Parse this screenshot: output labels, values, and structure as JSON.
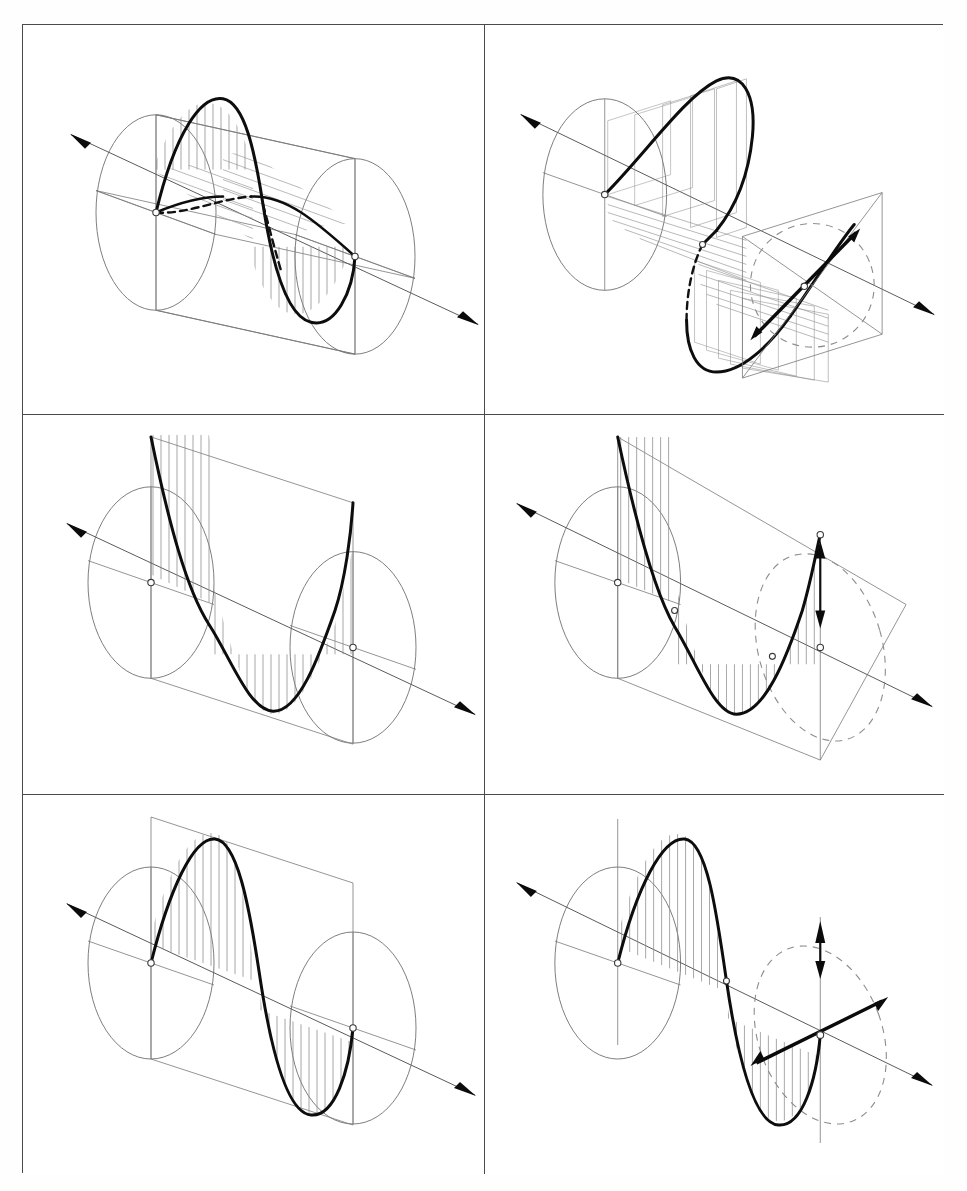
{
  "figure": {
    "layout": {
      "columns": 2,
      "rows": 3,
      "panel_count": 6
    },
    "style": {
      "background": "#ffffff",
      "frame_color": "#4a4a4a",
      "curve_color": "#0d0d0d",
      "construction_color": "#7a7a7a",
      "hatch_color": "#8a8a8a",
      "dashed_color": "#8d8d8d"
    }
  },
  "panels": [
    {
      "id": "panel-1",
      "position": "top-left",
      "name": "circularly-polarized-wave-in-cylinder",
      "description": "Two orthogonal sine components drawn inside a transparent cylinder; vertical hatching on the vertical-plane component and oblique hatching on the horizontal-plane component.",
      "elements": [
        "propagation-axis-arrow",
        "left-end-circle",
        "right-end-circle",
        "cylinder-outline",
        "vertical-plane-rectangle",
        "horizontal-plane-rectangle",
        "sine-curve-vertical",
        "sine-curve-horizontal",
        "vertical-hatching",
        "oblique-hatching",
        "node-markers",
        "hidden-dashed-segments"
      ],
      "wave": {
        "cycles": 1,
        "amplitude_rel": 1.0,
        "phase_deg": 0,
        "hatch_direction": "vertical+oblique"
      }
    },
    {
      "id": "panel-2",
      "position": "top-right",
      "name": "rotating-field-with-projection-screen",
      "description": "Helical field vector traced by stepped rectangular slabs; a square projection screen at right carries a dashed ellipse and a bold double-headed resultant vector.",
      "elements": [
        "propagation-axis-arrow",
        "left-end-circle",
        "stepped-slabs-upper",
        "stepped-slabs-lower",
        "envelope-curve",
        "projection-screen-square",
        "dashed-ellipse",
        "resultant-vector-double-arrow",
        "node-markers"
      ],
      "wave": {
        "cycles": 1,
        "amplitude_rel": 1.0,
        "phase_deg": 0,
        "hatch_direction": "stepped-slabs"
      }
    },
    {
      "id": "panel-3",
      "position": "middle-left",
      "name": "plane-polarized-sine-wave",
      "description": "Single sine wave of one full cycle drawn in a vertical plane with vertical hatching between the curve and the propagation axis.",
      "elements": [
        "propagation-axis-arrow",
        "left-end-circle",
        "right-end-circle",
        "vertical-plane-rectangle",
        "sine-curve",
        "vertical-hatching",
        "node-markers"
      ],
      "wave": {
        "cycles": 1,
        "amplitude_rel": 1.0,
        "phase_deg": 90,
        "hatch_direction": "vertical"
      }
    },
    {
      "id": "panel-4",
      "position": "middle-right",
      "name": "plane-polarized-wave-with-amplitude-arrow",
      "description": "Same plane-polarized sine wave with a dashed ellipse at the right end and a vertical double-headed arrow marking the instantaneous amplitude.",
      "elements": [
        "propagation-axis-arrow",
        "left-end-circle",
        "vertical-plane-rectangle",
        "sine-curve",
        "vertical-hatching",
        "dashed-ellipse",
        "amplitude-double-arrow",
        "node-markers"
      ],
      "wave": {
        "cycles": 1,
        "amplitude_rel": 1.0,
        "phase_deg": 90,
        "hatch_direction": "vertical"
      }
    },
    {
      "id": "panel-5",
      "position": "bottom-left",
      "name": "sine-wave-shifted-phase",
      "description": "Sine wave rising from the left node, crest first then trough, inside a vertical plane with vertical hatching to the axis.",
      "elements": [
        "propagation-axis-arrow",
        "left-end-circle",
        "right-end-circle",
        "vertical-plane-rectangle",
        "sine-curve",
        "vertical-hatching",
        "node-markers"
      ],
      "wave": {
        "cycles": 1,
        "amplitude_rel": 1.0,
        "phase_deg": 0,
        "hatch_direction": "vertical"
      }
    },
    {
      "id": "panel-6",
      "position": "bottom-right",
      "name": "sine-wave-with-field-vectors",
      "description": "Sine wave with a vertical reference line, dashed ellipse at the right, a vertical double-headed arrow and an oblique double-headed resultant vector through the right node.",
      "elements": [
        "propagation-axis-arrow",
        "left-end-circle",
        "vertical-reference-line",
        "sine-curve",
        "vertical-hatching",
        "dashed-ellipse",
        "amplitude-double-arrow",
        "resultant-vector-double-arrow",
        "node-markers"
      ],
      "wave": {
        "cycles": 1,
        "amplitude_rel": 1.0,
        "phase_deg": 0,
        "hatch_direction": "vertical"
      }
    }
  ]
}
